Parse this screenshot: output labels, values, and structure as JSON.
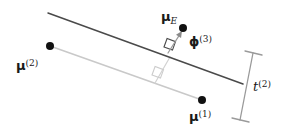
{
  "figure": {
    "background_color": "#ffffff",
    "width": 286,
    "height": 134,
    "colors": {
      "boundary_line": "#4a4a4a",
      "mean_line": "#c9c9c9",
      "projection_line": "#b4b4b4",
      "point_fill": "#111111",
      "text": "#1a1a1a",
      "tbar": "#8f8f8f"
    },
    "labels": {
      "mu_e": {
        "base": "μ",
        "sub": "E",
        "sup": ""
      },
      "mu_2": {
        "base": "μ",
        "sub": "",
        "sup": "(2)"
      },
      "mu_1": {
        "base": "μ",
        "sub": "",
        "sup": "(1)"
      },
      "phi_3": {
        "base": "ϕ",
        "sub": "",
        "sup": "(3)"
      },
      "t_2": {
        "base": "t",
        "sub": "",
        "sup": "(2)"
      }
    },
    "points": [
      {
        "name": "mu-e-point",
        "x": 183,
        "y": 28,
        "r": 4.0
      },
      {
        "name": "mu-2-point",
        "x": 50,
        "y": 46,
        "r": 4.0
      },
      {
        "name": "mu-1-point",
        "x": 202,
        "y": 100,
        "r": 4.0
      }
    ],
    "lines": {
      "boundary": {
        "x1": 48,
        "y1": 13,
        "x2": 243,
        "y2": 84
      },
      "mean_line": {
        "x1": 50,
        "y1": 46,
        "x2": 202,
        "y2": 100
      },
      "phi_arrow": {
        "x1": 168,
        "y1": 53,
        "x2": 182,
        "y2": 31
      },
      "drop_line": {
        "x1": 170,
        "y1": 57,
        "x2": 155,
        "y2": 83
      },
      "tbar_axis": {
        "x1": 253,
        "y1": 53,
        "x2": 240,
        "y2": 120
      },
      "tbar_cap_top": {
        "x1": 245,
        "y1": 51,
        "x2": 262,
        "y2": 55
      },
      "tbar_cap_bottom": {
        "x1": 232,
        "y1": 118,
        "x2": 249,
        "y2": 122
      }
    },
    "right_angle_markers": [
      {
        "name": "right-angle-boundary",
        "x": 164,
        "y": 47,
        "size": 9,
        "color": "#4a4a4a"
      },
      {
        "name": "right-angle-meanline",
        "x": 152,
        "y": 75,
        "size": 9,
        "color": "#cccccc"
      }
    ]
  }
}
